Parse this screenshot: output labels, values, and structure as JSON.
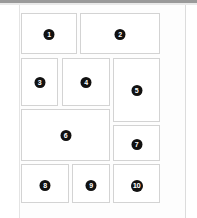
{
  "window": {
    "title": "Numbered Panel Layout",
    "background_color": "#ffffff",
    "page_color": "#fdfdfd",
    "top_bar_color": "#9a9a9a"
  },
  "theme": {
    "panel_border_color": "#d3d3d3",
    "panel_fill_color": "#ffffff",
    "badge_fill_color": "#111111",
    "badge_text_color": "#ffffff"
  },
  "layout": {
    "kind": "numbered-panel-grid",
    "panel_count": 10,
    "rows": 4
  },
  "panels": [
    {
      "id": "panel-1",
      "label": "1",
      "row": 1,
      "x": 21,
      "y": 13,
      "width": 56,
      "height": 41,
      "badge_size": "sz-sm",
      "badge_top": 15
    },
    {
      "id": "panel-2",
      "label": "2",
      "row": 1,
      "x": 80,
      "y": 13,
      "width": 80,
      "height": 41,
      "badge_size": "sz-sm",
      "badge_top": 15
    },
    {
      "id": "panel-3",
      "label": "3",
      "row": 2,
      "x": 21,
      "y": 58,
      "width": 37,
      "height": 48,
      "badge_size": "sz-sm",
      "badge_top": 18
    },
    {
      "id": "panel-4",
      "label": "4",
      "row": 2,
      "x": 62,
      "y": 58,
      "width": 48,
      "height": 48,
      "badge_size": "sz-sm",
      "badge_top": 18
    },
    {
      "id": "panel-5",
      "label": "5",
      "row": 2,
      "x": 113,
      "y": 58,
      "width": 47,
      "height": 64,
      "badge_size": "sz-sm",
      "badge_top": 26
    },
    {
      "id": "panel-6",
      "label": "6",
      "row": 3,
      "x": 21,
      "y": 109,
      "width": 89,
      "height": 52,
      "badge_size": "sz-sm",
      "badge_top": 20
    },
    {
      "id": "panel-7",
      "label": "7",
      "row": 3,
      "x": 113,
      "y": 125,
      "width": 47,
      "height": 36,
      "badge_size": "sz-sm",
      "badge_top": 13
    },
    {
      "id": "panel-8",
      "label": "8",
      "row": 4,
      "x": 21,
      "y": 164,
      "width": 48,
      "height": 39,
      "badge_size": "sz-sm",
      "badge_top": 15
    },
    {
      "id": "panel-9",
      "label": "9",
      "row": 4,
      "x": 72,
      "y": 164,
      "width": 38,
      "height": 39,
      "badge_size": "sz-sm",
      "badge_top": 15
    },
    {
      "id": "panel-10",
      "label": "10",
      "row": 4,
      "x": 113,
      "y": 164,
      "width": 47,
      "height": 39,
      "badge_size": "sz-md",
      "badge_top": 15
    }
  ]
}
